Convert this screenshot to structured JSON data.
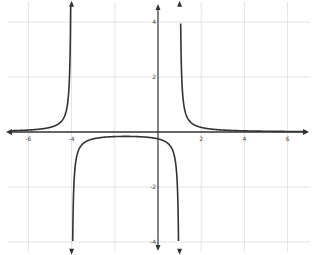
{
  "chart_data": {
    "type": "line",
    "title": "",
    "xlabel": "",
    "ylabel": "",
    "xlim": [
      -7.3,
      7.3
    ],
    "ylim": [
      -4.5,
      4.8
    ],
    "grid": true,
    "x_ticks": [
      -6,
      -4,
      2,
      4,
      6
    ],
    "x_tick_labels": [
      "-6",
      "-4",
      "2",
      "4",
      "6"
    ],
    "y_ticks": [
      4,
      2,
      -2,
      -4
    ],
    "y_tick_labels": [
      "4",
      "2",
      "-2",
      "-4"
    ],
    "function": "y = 1/((x+4)(x-1))",
    "vertical_asymptotes": [
      -4,
      1
    ],
    "horizontal_asymptote": 0,
    "series": [
      {
        "name": "left branch",
        "x": [
          -7,
          -6,
          -5,
          -4.5,
          -4.2,
          -4.1
        ],
        "y": [
          0.042,
          0.071,
          0.167,
          0.364,
          0.962,
          1.96
        ]
      },
      {
        "name": "middle branch",
        "x": [
          -3.9,
          -3.5,
          -3,
          -2,
          -1.5,
          0,
          0.5,
          0.9
        ],
        "y": [
          -2.04,
          -0.444,
          -0.25,
          -0.167,
          -0.16,
          -0.25,
          -0.444,
          -2.04
        ]
      },
      {
        "name": "right branch",
        "x": [
          1.1,
          1.5,
          2,
          3,
          4,
          6,
          7
        ],
        "y": [
          1.96,
          0.364,
          0.167,
          0.071,
          0.042,
          0.02,
          0.015
        ]
      }
    ],
    "colors": {
      "curve": "#333333",
      "axis": "#333333",
      "grid": "#d8d8d8"
    }
  }
}
